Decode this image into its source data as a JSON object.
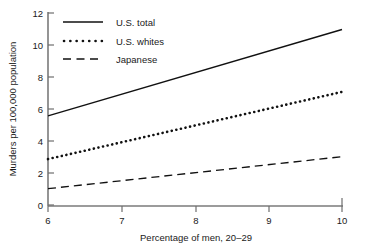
{
  "chart_data": {
    "type": "line",
    "title": "",
    "subtitle": "",
    "xlabel": "Percentage of men, 20–29",
    "ylabel": "Murders per 100,000 population",
    "xlim": [
      6,
      10
    ],
    "ylim": [
      0,
      12
    ],
    "xticks": [
      "6",
      "7",
      "8",
      "9",
      "10"
    ],
    "xtick_values": [
      6,
      7,
      8,
      9,
      10
    ],
    "yticks": [
      "0",
      "2",
      "4",
      "6",
      "8",
      "10",
      "12"
    ],
    "ytick_values": [
      0,
      2,
      4,
      6,
      8,
      10,
      12
    ],
    "grid": false,
    "legend_position": "top-left",
    "x": [
      6,
      10
    ],
    "series": [
      {
        "name": "U.S. total",
        "style": "solid",
        "values": [
          5.6,
          11.0
        ],
        "color": "#111111"
      },
      {
        "name": "U.S. whites",
        "style": "dotted",
        "values": [
          2.9,
          7.1
        ],
        "color": "#111111"
      },
      {
        "name": "Japanese",
        "style": "dashed",
        "values": [
          1.05,
          3.05
        ],
        "color": "#111111"
      }
    ],
    "legend": [
      "U.S. total",
      "U.S. whites",
      "Japanese"
    ]
  }
}
